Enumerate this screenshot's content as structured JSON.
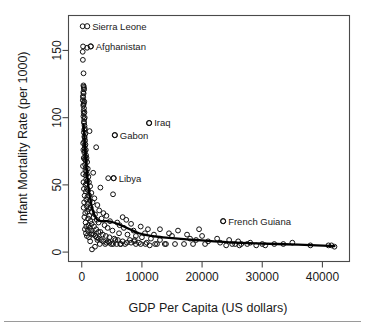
{
  "chart_data": {
    "type": "scatter",
    "title": "",
    "xlabel": "GDP Per Capita (US dollars)",
    "ylabel": "Infant Mortality Rate (per 1000)",
    "xlim": [
      -2200,
      44500
    ],
    "ylim": [
      -7,
      176
    ],
    "xticks": [
      0,
      10000,
      20000,
      30000,
      40000
    ],
    "xticklabels": [
      "0",
      "10000",
      "20000",
      "30000",
      "40000"
    ],
    "yticks": [
      0,
      50,
      100,
      150
    ],
    "yticklabels": [
      "0",
      "50",
      "100",
      "150"
    ],
    "grid": false,
    "legend": null,
    "marker": "open-circle",
    "annotations": [
      {
        "label": "Sierra Leone",
        "x": 900,
        "y": 168
      },
      {
        "label": "Afghanistan",
        "x": 1500,
        "y": 153
      },
      {
        "label": "Iraq",
        "x": 11200,
        "y": 96
      },
      {
        "label": "Gabon",
        "x": 5500,
        "y": 87
      },
      {
        "label": "Libya",
        "x": 5300,
        "y": 55
      },
      {
        "label": "French Guiana",
        "x": 23500,
        "y": 23
      }
    ],
    "fit_curve": {
      "kind": "lowess",
      "x": [
        300,
        900,
        1600,
        2400,
        3200,
        4200,
        5300,
        6500,
        8000,
        9500,
        11500,
        13500,
        16000,
        19000,
        22000,
        25500,
        29000,
        32500,
        36000,
        39000,
        42000
      ],
      "y": [
        95,
        57,
        35,
        25,
        23,
        23,
        22,
        20,
        17,
        14,
        12,
        11,
        10,
        9,
        8,
        7,
        6.5,
        6,
        5.5,
        5,
        4.5
      ]
    },
    "points": [
      [
        150,
        168
      ],
      [
        220,
        153
      ],
      [
        900,
        152
      ],
      [
        1500,
        153
      ],
      [
        160,
        149
      ],
      [
        190,
        143
      ],
      [
        300,
        133
      ],
      [
        280,
        124
      ],
      [
        330,
        123
      ],
      [
        350,
        122
      ],
      [
        400,
        121
      ],
      [
        260,
        119
      ],
      [
        310,
        118
      ],
      [
        200,
        116
      ],
      [
        240,
        115
      ],
      [
        180,
        113
      ],
      [
        420,
        112
      ],
      [
        350,
        111
      ],
      [
        300,
        110
      ],
      [
        260,
        109
      ],
      [
        380,
        107
      ],
      [
        310,
        105
      ],
      [
        450,
        104
      ],
      [
        340,
        103
      ],
      [
        280,
        101
      ],
      [
        500,
        100
      ],
      [
        1300,
        90
      ],
      [
        420,
        99
      ],
      [
        360,
        97
      ],
      [
        390,
        96
      ],
      [
        5500,
        87
      ],
      [
        11200,
        96
      ],
      [
        460,
        94
      ],
      [
        520,
        92
      ],
      [
        410,
        91
      ],
      [
        350,
        89
      ],
      [
        600,
        88
      ],
      [
        440,
        86
      ],
      [
        480,
        85
      ],
      [
        2400,
        78
      ],
      [
        560,
        83
      ],
      [
        390,
        82
      ],
      [
        620,
        80
      ],
      [
        510,
        79
      ],
      [
        470,
        77
      ],
      [
        680,
        76
      ],
      [
        540,
        75
      ],
      [
        430,
        74
      ],
      [
        720,
        72
      ],
      [
        590,
        71
      ],
      [
        800,
        70
      ],
      [
        500,
        69
      ],
      [
        640,
        68
      ],
      [
        900,
        67
      ],
      [
        560,
        65
      ],
      [
        1900,
        59
      ],
      [
        700,
        63
      ],
      [
        1000,
        62
      ],
      [
        610,
        61
      ],
      [
        760,
        60
      ],
      [
        5300,
        55
      ],
      [
        4400,
        55
      ],
      [
        850,
        58
      ],
      [
        660,
        57
      ],
      [
        1100,
        56
      ],
      [
        730,
        54
      ],
      [
        950,
        53
      ],
      [
        1200,
        52
      ],
      [
        790,
        51
      ],
      [
        620,
        50
      ],
      [
        1400,
        49
      ],
      [
        3100,
        48
      ],
      [
        880,
        47
      ],
      [
        1050,
        46
      ],
      [
        680,
        45
      ],
      [
        1600,
        44
      ],
      [
        5200,
        43
      ],
      [
        1250,
        42
      ],
      [
        940,
        41
      ],
      [
        2100,
        40
      ],
      [
        760,
        39
      ],
      [
        1350,
        38
      ],
      [
        1800,
        37
      ],
      [
        1000,
        36
      ],
      [
        2600,
        35
      ],
      [
        840,
        34
      ],
      [
        1500,
        33
      ],
      [
        1150,
        32
      ],
      [
        2900,
        31
      ],
      [
        1700,
        30
      ],
      [
        920,
        30
      ],
      [
        3600,
        29
      ],
      [
        2200,
        28
      ],
      [
        1250,
        27
      ],
      [
        4100,
        27
      ],
      [
        1950,
        26
      ],
      [
        6800,
        26
      ],
      [
        3300,
        25
      ],
      [
        1050,
        25
      ],
      [
        2500,
        24
      ],
      [
        7400,
        24
      ],
      [
        1450,
        23
      ],
      [
        4700,
        23
      ],
      [
        23500,
        23
      ],
      [
        2800,
        22
      ],
      [
        5900,
        22
      ],
      [
        1650,
        21
      ],
      [
        8200,
        21
      ],
      [
        3800,
        20
      ],
      [
        1150,
        20
      ],
      [
        6300,
        20
      ],
      [
        2050,
        19
      ],
      [
        9800,
        19
      ],
      [
        4300,
        18
      ],
      [
        1350,
        18
      ],
      [
        7000,
        18
      ],
      [
        2400,
        17
      ],
      [
        11000,
        17
      ],
      [
        5100,
        16
      ],
      [
        1550,
        16
      ],
      [
        8600,
        16
      ],
      [
        13000,
        17
      ],
      [
        2750,
        15
      ],
      [
        19500,
        17
      ],
      [
        3100,
        15
      ],
      [
        16000,
        16
      ],
      [
        6200,
        14
      ],
      [
        1750,
        14
      ],
      [
        10500,
        14
      ],
      [
        14500,
        14
      ],
      [
        3500,
        13
      ],
      [
        2000,
        13
      ],
      [
        7600,
        13
      ],
      [
        17500,
        13
      ],
      [
        12000,
        13
      ],
      [
        4000,
        12
      ],
      [
        2250,
        12
      ],
      [
        9000,
        12
      ],
      [
        20000,
        12
      ],
      [
        15000,
        12
      ],
      [
        4600,
        11
      ],
      [
        2500,
        11
      ],
      [
        10000,
        11
      ],
      [
        22500,
        10
      ],
      [
        18000,
        10
      ],
      [
        5400,
        10
      ],
      [
        2800,
        10
      ],
      [
        11500,
        10
      ],
      [
        24500,
        9
      ],
      [
        19000,
        9
      ],
      [
        6000,
        9
      ],
      [
        3200,
        9
      ],
      [
        13000,
        9
      ],
      [
        26000,
        8
      ],
      [
        21000,
        8
      ],
      [
        6800,
        8
      ],
      [
        3600,
        8
      ],
      [
        8700,
        8
      ],
      [
        28000,
        7
      ],
      [
        23000,
        7
      ],
      [
        7500,
        7
      ],
      [
        4100,
        7
      ],
      [
        9500,
        7
      ],
      [
        25500,
        6
      ],
      [
        30000,
        6
      ],
      [
        8200,
        7
      ],
      [
        4600,
        7
      ],
      [
        10800,
        7
      ],
      [
        26500,
        6
      ],
      [
        32000,
        6
      ],
      [
        9000,
        6
      ],
      [
        5200,
        6
      ],
      [
        12200,
        6
      ],
      [
        27500,
        6
      ],
      [
        33500,
        6
      ],
      [
        9800,
        6
      ],
      [
        5800,
        6
      ],
      [
        14000,
        6
      ],
      [
        29000,
        5
      ],
      [
        35000,
        7
      ],
      [
        10600,
        6
      ],
      [
        6500,
        6
      ],
      [
        15500,
        6
      ],
      [
        30500,
        5
      ],
      [
        38000,
        5
      ],
      [
        11300,
        5
      ],
      [
        7200,
        6
      ],
      [
        17000,
        6
      ],
      [
        24000,
        5
      ],
      [
        41000,
        5
      ],
      [
        12500,
        6
      ],
      [
        8000,
        9
      ],
      [
        18500,
        6
      ],
      [
        25000,
        6
      ],
      [
        41500,
        5
      ],
      [
        13800,
        6
      ],
      [
        8800,
        9
      ],
      [
        20500,
        6
      ],
      [
        26200,
        5
      ],
      [
        42000,
        4
      ],
      [
        1700,
        2
      ],
      [
        2200,
        4
      ],
      [
        1400,
        8
      ],
      [
        3000,
        6
      ],
      [
        2600,
        9
      ],
      [
        3900,
        6
      ],
      [
        4400,
        8
      ],
      [
        4900,
        6
      ],
      [
        5600,
        9
      ],
      [
        6400,
        6
      ],
      [
        700,
        14
      ],
      [
        850,
        12
      ],
      [
        1000,
        16
      ],
      [
        1200,
        11
      ],
      [
        1600,
        13
      ],
      [
        520,
        17
      ],
      [
        640,
        22
      ],
      [
        760,
        19
      ],
      [
        440,
        26
      ],
      [
        580,
        29
      ],
      [
        320,
        33
      ],
      [
        400,
        37
      ],
      [
        480,
        42
      ],
      [
        360,
        47
      ],
      [
        290,
        52
      ],
      [
        250,
        58
      ],
      [
        210,
        64
      ],
      [
        330,
        70
      ],
      [
        270,
        76
      ],
      [
        230,
        81
      ]
    ]
  },
  "figure": {
    "background": "#ffffff",
    "axis_color": "#4a4a4a",
    "point_color": "#111111",
    "curve_color": "#000000",
    "footer_rule_color": "#9a9a9a"
  }
}
